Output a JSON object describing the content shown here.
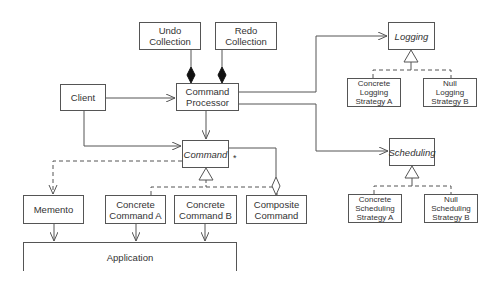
{
  "diagram": {
    "classes": {
      "undo_collection": "Undo\nCollection",
      "redo_collection": "Redo\nCollection",
      "client": "Client",
      "command_processor": "Command\nProcessor",
      "command": "Command",
      "logging": "Logging",
      "concrete_logging_a": "Concrete\nLogging\nStrategy A",
      "null_logging_b": "Null\nLogging\nStrategy B",
      "scheduling": "Scheduling",
      "concrete_scheduling_a": "Concrete\nScheduling\nStrategy A",
      "null_scheduling_b": "Null\nScheduling\nStrategy B",
      "memento": "Memento",
      "concrete_command_a": "Concrete\nCommand A",
      "concrete_command_b": "Concrete\nCommand B",
      "composite_command": "Composite\nCommand",
      "application": "Application"
    },
    "multiplicity": "*",
    "colors": {
      "line": "#555555",
      "text": "#333333",
      "background": "#ffffff"
    }
  }
}
